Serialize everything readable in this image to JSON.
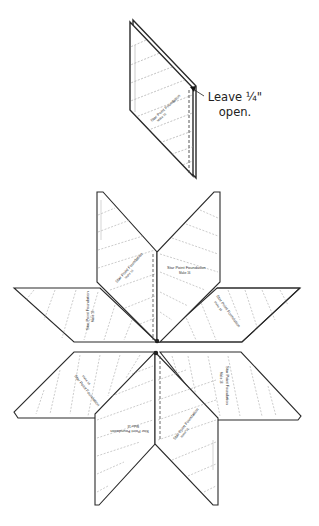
{
  "diagram": {
    "type": "quilting-instruction",
    "colors": {
      "outline": "#2a2a2a",
      "seam_dashed": "#555555",
      "stitch_lines": "#9a9a9a",
      "fill": "#ffffff"
    },
    "top_piece": {
      "name": "single-star-point-sewn",
      "label": "Star Point Foundation",
      "sublabel": "Make 16",
      "callout": {
        "line1": "Leave ¼\"",
        "line2": "open."
      }
    },
    "star": {
      "name": "eight-point-star-assembly",
      "points": [
        {
          "id": "upper-left-vertical",
          "label": "Star Point Foundation",
          "sublabel": "Make 16"
        },
        {
          "id": "upper-right-vertical",
          "label": "Star Point Foundation",
          "sublabel": "Make 16"
        },
        {
          "id": "left-upper-horizontal",
          "label": "Star Point Foundation",
          "sublabel": "Make 16"
        },
        {
          "id": "right-upper-horizontal",
          "label": "Star Point Foundation",
          "sublabel": "Make 16"
        },
        {
          "id": "left-lower-horizontal",
          "label": "Star Point Foundation",
          "sublabel": "Make 16"
        },
        {
          "id": "right-lower-horizontal",
          "label": "Star Point Foundation",
          "sublabel": "Make 16"
        },
        {
          "id": "lower-left-vertical",
          "label": "Star Point Foundation",
          "sublabel": "Make 16"
        },
        {
          "id": "lower-right-vertical",
          "label": "Star Point Foundation",
          "sublabel": "Make 16"
        }
      ]
    }
  }
}
